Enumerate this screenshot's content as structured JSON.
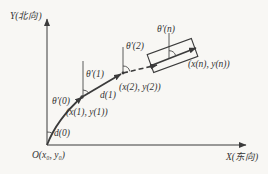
{
  "diagram": {
    "title_semantic": "dead-reckoning-trajectory-diagram",
    "ink_color": "#3b3b3b",
    "background_color": "#f8f7f4",
    "axes": {
      "y_label": "Y(北向)",
      "x_label": "X(东向)",
      "origin_label": "O(x₀, y₀)"
    },
    "headings": {
      "theta_0": "θ′(0)",
      "theta_1": "θ′(1)",
      "theta_2": "θ′(2)",
      "theta_n": "θ′(n)"
    },
    "distances": {
      "d_0": "d(0)",
      "d_1": "d(1)"
    },
    "points": {
      "p1": "(x(1), y(1))",
      "p2": "(x(2), y(2))",
      "pn": "(x(n), y(n))"
    }
  }
}
